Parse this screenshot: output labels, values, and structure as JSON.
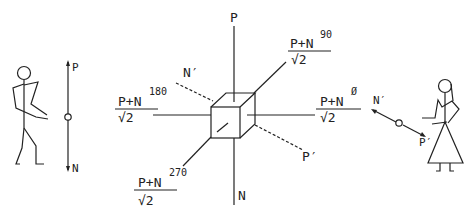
{
  "diagram": {
    "left_figure": {
      "axis_top_label": "P",
      "axis_bottom_label": "N"
    },
    "center": {
      "axis_labels": {
        "top": "P",
        "bottom": "N",
        "dashed_upper_left": "N′",
        "dashed_lower_right": "P′"
      },
      "fractions": [
        {
          "id": "n90",
          "numerator": "P+N",
          "superscript": "90",
          "denominator": "√2"
        },
        {
          "id": "n180",
          "numerator": "P+N",
          "superscript": "180",
          "denominator": "√2"
        },
        {
          "id": "n0",
          "numerator": "P+N",
          "superscript": "Ø",
          "denominator": "√2"
        },
        {
          "id": "n270",
          "numerator": "P+N",
          "superscript": "270",
          "denominator": "√2"
        }
      ]
    },
    "right_figure": {
      "axis_upper_label": "N′",
      "axis_lower_label": "P′"
    },
    "colors": {
      "ink": "#222222",
      "background": "#ffffff"
    }
  }
}
